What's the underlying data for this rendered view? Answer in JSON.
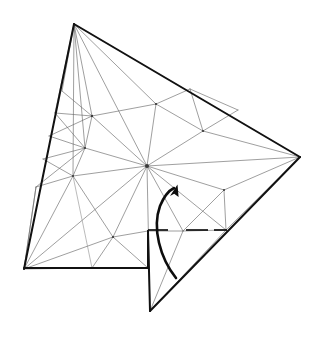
{
  "figure": {
    "type": "geometry-mesh-diagram",
    "background_color": "#ffffff",
    "boundary_color": "#111111",
    "interior_edge_color": "#6a6a6a",
    "arrow_color": "#0d0d0d",
    "canvas": {
      "width": 321,
      "height": 339
    }
  },
  "geometry": {
    "description": "Non-convex kite/arrow shaped domain subdivided into triangular elements, with a slit notch at the lower middle and a curved rotation arrow indicating counter-clockwise motion about the slit.",
    "boundary_vertices": [
      {
        "name": "top-apex",
        "x": 74,
        "y": 24
      },
      {
        "name": "right-apex",
        "x": 300,
        "y": 157
      },
      {
        "name": "notch-bottom",
        "x": 150,
        "y": 311
      },
      {
        "name": "notch-inner-top",
        "x": 148,
        "y": 231
      },
      {
        "name": "bottom-left",
        "x": 24,
        "y": 269
      }
    ],
    "hub_node": {
      "name": "central-hub",
      "x": 147,
      "y": 166,
      "valence": 16
    },
    "interior_nodes": [
      {
        "x": 62,
        "y": 91
      },
      {
        "x": 55,
        "y": 113
      },
      {
        "x": 49,
        "y": 136
      },
      {
        "x": 43,
        "y": 159
      },
      {
        "x": 36,
        "y": 187
      },
      {
        "x": 92,
        "y": 116
      },
      {
        "x": 85,
        "y": 148
      },
      {
        "x": 73,
        "y": 176
      },
      {
        "x": 113,
        "y": 237
      },
      {
        "x": 156,
        "y": 104
      },
      {
        "x": 190,
        "y": 89
      },
      {
        "x": 203,
        "y": 131
      },
      {
        "x": 224,
        "y": 190
      },
      {
        "x": 226,
        "y": 230
      },
      {
        "x": 183,
        "y": 231
      }
    ],
    "boundary_segments": [
      {
        "name": "top-left-edge",
        "from": "top-apex",
        "to": "bottom-left",
        "weight": "bold"
      },
      {
        "name": "top-right-edge",
        "from": "top-apex",
        "to": "right-apex",
        "weight": "bold"
      },
      {
        "name": "lower-right-edge",
        "from": "right-apex",
        "to": "notch-bottom",
        "weight": "bold"
      },
      {
        "name": "notch-right-edge",
        "from": "notch-bottom",
        "to": "notch-inner-top",
        "weight": "bold"
      },
      {
        "name": "notch-upper-edge",
        "from": "notch-inner-top",
        "to": "slit-right-end",
        "weight": "bold"
      },
      {
        "name": "bottom-edge",
        "from": "notch-inner-top",
        "to": "bottom-left",
        "weight": "bold"
      }
    ]
  },
  "rotation_arrow": {
    "name": "rotation-arrow",
    "direction": "counter-clockwise",
    "start": {
      "x": 176,
      "y": 278
    },
    "end": {
      "x": 175,
      "y": 187
    },
    "head_angle_deg": 20
  }
}
